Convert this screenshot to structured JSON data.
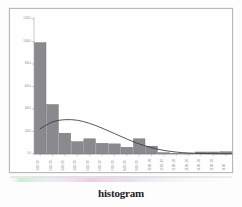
{
  "figure": {
    "caption": "histogram",
    "frame_color": "#b9b9bb",
    "background_color": "#fefefe"
  },
  "scan_strip": {
    "name": "color-calibration-strip",
    "colors": [
      "#cfeccf",
      "#d6f0e2",
      "#f3d6e8",
      "#efc9de",
      "#dfe3f0",
      "#f6f6f7"
    ]
  },
  "chart_data": {
    "type": "bar",
    "title": "histogram",
    "xlabel": "",
    "ylabel": "",
    "grid": false,
    "legend": null,
    "bar_color": "#8a8a8e",
    "bar_edge_color": "#6e6e73",
    "curve_color": "#3a3a3e",
    "curve_label": "normal distribution overlay",
    "ylim": [
      0,
      1200
    ],
    "yticks": [
      0,
      200,
      400,
      600,
      800,
      1000,
      1200
    ],
    "ytick_labels": [
      "0.0",
      "200.0",
      "400.0",
      "600.0",
      "800.0",
      "1000.0",
      "1200.0"
    ],
    "categories": [
      "1.00 - 99",
      "2.00 - 99",
      "3.00 - 99",
      "4.00 - 99",
      "5.00 - 99",
      "6.00 - 99",
      "7.00 - 99",
      "8.00 - 99",
      "9.00 - 99",
      "10.00 - 99",
      "11.00 - 99",
      "12.00 - 99",
      "13.00 - 99",
      "14.00 - 99",
      "15.00 - 99",
      "16.00"
    ],
    "values": [
      990,
      440,
      185,
      110,
      135,
      95,
      90,
      60,
      135,
      70,
      12,
      6,
      5,
      18,
      18,
      20
    ],
    "curve_x": [
      0,
      1,
      2,
      3,
      4,
      5,
      6,
      7,
      8,
      9,
      10,
      11,
      12,
      13,
      14,
      15
    ],
    "curve_y": [
      225,
      285,
      305,
      300,
      272,
      230,
      182,
      133,
      90,
      56,
      32,
      17,
      9,
      5,
      3,
      2
    ]
  }
}
